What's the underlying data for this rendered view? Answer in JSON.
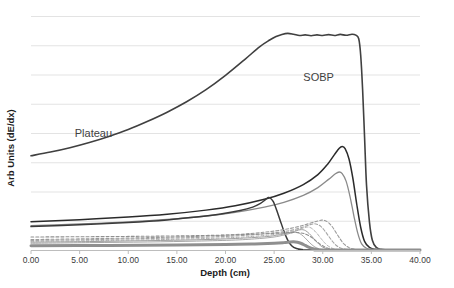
{
  "chart_data": {
    "type": "line",
    "title": "",
    "xlabel": "Depth (cm)",
    "ylabel": "Arb Units (dE/dx)",
    "xlim": [
      0,
      40
    ],
    "ylim": [
      0,
      1.08
    ],
    "xticks": [
      "0.00",
      "5.00",
      "10.00",
      "15.00",
      "20.00",
      "25.00",
      "30.00",
      "35.00",
      "40.00"
    ],
    "xtick_values": [
      0,
      5,
      10,
      15,
      20,
      25,
      30,
      35,
      40
    ],
    "yticks": [],
    "grid": "horizontal",
    "legend": "none",
    "annotations": [
      {
        "text": "SOBP",
        "x": 28.0,
        "y": 0.78,
        "name": "sobp-annotation"
      },
      {
        "text": "Plateau",
        "x": 4.5,
        "y": 0.52,
        "name": "plateau-annotation"
      }
    ],
    "series": [
      {
        "name": "SOBP composite",
        "style": "solid",
        "color": "#404040",
        "width": 1.6,
        "points": [
          [
            0.0,
            0.435
          ],
          [
            2.0,
            0.452
          ],
          [
            4.0,
            0.472
          ],
          [
            6.0,
            0.496
          ],
          [
            8.0,
            0.524
          ],
          [
            10.0,
            0.556
          ],
          [
            12.0,
            0.594
          ],
          [
            14.0,
            0.636
          ],
          [
            16.0,
            0.684
          ],
          [
            18.0,
            0.74
          ],
          [
            20.0,
            0.806
          ],
          [
            22.0,
            0.88
          ],
          [
            23.5,
            0.938
          ],
          [
            24.5,
            0.968
          ],
          [
            25.2,
            0.985
          ],
          [
            25.8,
            0.995
          ],
          [
            26.4,
            1.0
          ],
          [
            27.0,
            0.996
          ],
          [
            27.6,
            0.99
          ],
          [
            28.2,
            0.993
          ],
          [
            28.8,
            0.989
          ],
          [
            29.4,
            0.993
          ],
          [
            30.0,
            0.99
          ],
          [
            30.6,
            0.994
          ],
          [
            31.2,
            0.99
          ],
          [
            31.8,
            0.995
          ],
          [
            32.4,
            0.991
          ],
          [
            33.0,
            0.996
          ],
          [
            33.4,
            0.992
          ],
          [
            33.7,
            0.975
          ],
          [
            33.9,
            0.9
          ],
          [
            34.1,
            0.74
          ],
          [
            34.3,
            0.52
          ],
          [
            34.5,
            0.3
          ],
          [
            34.8,
            0.13
          ],
          [
            35.1,
            0.045
          ],
          [
            35.5,
            0.012
          ],
          [
            36.0,
            0.003
          ],
          [
            37.0,
            0.0
          ],
          [
            40.0,
            0.0
          ]
        ]
      },
      {
        "name": "Bragg peak 1 (highest weight, deepest)",
        "style": "solid",
        "color": "#2b2b2b",
        "width": 1.5,
        "points": [
          [
            0.0,
            0.13
          ],
          [
            5.0,
            0.14
          ],
          [
            10.0,
            0.152
          ],
          [
            14.0,
            0.165
          ],
          [
            18.0,
            0.184
          ],
          [
            21.0,
            0.204
          ],
          [
            24.0,
            0.234
          ],
          [
            26.0,
            0.262
          ],
          [
            28.0,
            0.302
          ],
          [
            29.5,
            0.348
          ],
          [
            30.5,
            0.396
          ],
          [
            31.2,
            0.44
          ],
          [
            31.7,
            0.47
          ],
          [
            32.0,
            0.478
          ],
          [
            32.3,
            0.468
          ],
          [
            32.7,
            0.42
          ],
          [
            33.1,
            0.33
          ],
          [
            33.5,
            0.21
          ],
          [
            33.9,
            0.105
          ],
          [
            34.3,
            0.04
          ],
          [
            34.8,
            0.012
          ],
          [
            35.4,
            0.003
          ],
          [
            36.0,
            0.0
          ],
          [
            40.0,
            0.0
          ]
        ]
      },
      {
        "name": "Bragg peak 2",
        "style": "solid",
        "color": "#8a8a8a",
        "width": 1.3,
        "points": [
          [
            0.0,
            0.112
          ],
          [
            5.0,
            0.12
          ],
          [
            10.0,
            0.13
          ],
          [
            14.0,
            0.141
          ],
          [
            18.0,
            0.157
          ],
          [
            21.0,
            0.174
          ],
          [
            24.0,
            0.198
          ],
          [
            26.0,
            0.22
          ],
          [
            28.0,
            0.252
          ],
          [
            29.5,
            0.288
          ],
          [
            30.6,
            0.326
          ],
          [
            31.3,
            0.352
          ],
          [
            31.7,
            0.36
          ],
          [
            32.0,
            0.352
          ],
          [
            32.4,
            0.318
          ],
          [
            32.8,
            0.248
          ],
          [
            33.2,
            0.158
          ],
          [
            33.6,
            0.078
          ],
          [
            34.0,
            0.028
          ],
          [
            34.5,
            0.008
          ],
          [
            35.0,
            0.002
          ],
          [
            36.0,
            0.0
          ],
          [
            40.0,
            0.0
          ]
        ]
      },
      {
        "name": "Bragg peak 3 (shallow, sharp)",
        "style": "solid",
        "color": "#3a3a3a",
        "width": 1.5,
        "points": [
          [
            0.0,
            0.108
          ],
          [
            5.0,
            0.116
          ],
          [
            10.0,
            0.127
          ],
          [
            14.0,
            0.139
          ],
          [
            17.0,
            0.152
          ],
          [
            19.5,
            0.166
          ],
          [
            21.5,
            0.182
          ],
          [
            22.8,
            0.198
          ],
          [
            23.6,
            0.215
          ],
          [
            24.1,
            0.232
          ],
          [
            24.4,
            0.242
          ],
          [
            24.6,
            0.24
          ],
          [
            24.9,
            0.224
          ],
          [
            25.2,
            0.192
          ],
          [
            25.6,
            0.14
          ],
          [
            26.0,
            0.088
          ],
          [
            26.4,
            0.046
          ],
          [
            26.8,
            0.02
          ],
          [
            27.3,
            0.007
          ],
          [
            27.9,
            0.002
          ],
          [
            28.6,
            0.0
          ],
          [
            40.0,
            0.0
          ]
        ]
      },
      {
        "name": "Bragg peak 4 (dashed)",
        "style": "dashed",
        "color": "#9a9a9a",
        "width": 1.1,
        "points": [
          [
            0.0,
            0.048
          ],
          [
            6.0,
            0.052
          ],
          [
            12.0,
            0.057
          ],
          [
            17.0,
            0.063
          ],
          [
            21.0,
            0.071
          ],
          [
            24.0,
            0.082
          ],
          [
            26.0,
            0.094
          ],
          [
            27.5,
            0.108
          ],
          [
            28.6,
            0.122
          ],
          [
            29.4,
            0.133
          ],
          [
            29.9,
            0.138
          ],
          [
            30.2,
            0.136
          ],
          [
            30.6,
            0.126
          ],
          [
            31.0,
            0.106
          ],
          [
            31.4,
            0.078
          ],
          [
            31.8,
            0.05
          ],
          [
            32.2,
            0.027
          ],
          [
            32.7,
            0.011
          ],
          [
            33.2,
            0.004
          ],
          [
            33.8,
            0.001
          ],
          [
            34.5,
            0.0
          ],
          [
            40.0,
            0.0
          ]
        ]
      },
      {
        "name": "Bragg peak 5 (dashed)",
        "style": "dashed",
        "color": "#a5a5a5",
        "width": 1.1,
        "points": [
          [
            0.0,
            0.044
          ],
          [
            6.0,
            0.048
          ],
          [
            12.0,
            0.053
          ],
          [
            17.0,
            0.058
          ],
          [
            21.0,
            0.065
          ],
          [
            24.0,
            0.075
          ],
          [
            26.0,
            0.085
          ],
          [
            27.2,
            0.096
          ],
          [
            28.1,
            0.108
          ],
          [
            28.7,
            0.117
          ],
          [
            29.1,
            0.121
          ],
          [
            29.4,
            0.119
          ],
          [
            29.8,
            0.109
          ],
          [
            30.2,
            0.089
          ],
          [
            30.6,
            0.064
          ],
          [
            31.0,
            0.04
          ],
          [
            31.4,
            0.021
          ],
          [
            31.9,
            0.008
          ],
          [
            32.4,
            0.003
          ],
          [
            33.0,
            0.001
          ],
          [
            33.6,
            0.0
          ],
          [
            40.0,
            0.0
          ]
        ]
      },
      {
        "name": "Bragg peak 6 (dashed)",
        "style": "dashed",
        "color": "#aeaeae",
        "width": 1.0,
        "points": [
          [
            0.0,
            0.04
          ],
          [
            6.0,
            0.043
          ],
          [
            12.0,
            0.047
          ],
          [
            17.0,
            0.052
          ],
          [
            21.0,
            0.058
          ],
          [
            24.0,
            0.067
          ],
          [
            25.8,
            0.077
          ],
          [
            26.9,
            0.087
          ],
          [
            27.6,
            0.096
          ],
          [
            28.1,
            0.103
          ],
          [
            28.4,
            0.106
          ],
          [
            28.7,
            0.104
          ],
          [
            29.0,
            0.095
          ],
          [
            29.4,
            0.077
          ],
          [
            29.8,
            0.054
          ],
          [
            30.2,
            0.033
          ],
          [
            30.6,
            0.017
          ],
          [
            31.1,
            0.006
          ],
          [
            31.6,
            0.002
          ],
          [
            32.2,
            0.0
          ],
          [
            40.0,
            0.0
          ]
        ]
      },
      {
        "name": "Bragg peak 7",
        "style": "solid",
        "color": "#9e9e9e",
        "width": 1.0,
        "points": [
          [
            0.0,
            0.036
          ],
          [
            6.0,
            0.039
          ],
          [
            12.0,
            0.043
          ],
          [
            17.0,
            0.047
          ],
          [
            21.0,
            0.053
          ],
          [
            24.0,
            0.061
          ],
          [
            25.4,
            0.069
          ],
          [
            26.4,
            0.078
          ],
          [
            27.1,
            0.086
          ],
          [
            27.5,
            0.092
          ],
          [
            27.8,
            0.094
          ],
          [
            28.1,
            0.092
          ],
          [
            28.4,
            0.084
          ],
          [
            28.8,
            0.067
          ],
          [
            29.2,
            0.046
          ],
          [
            29.6,
            0.027
          ],
          [
            30.0,
            0.013
          ],
          [
            30.5,
            0.005
          ],
          [
            31.0,
            0.001
          ],
          [
            31.6,
            0.0
          ],
          [
            40.0,
            0.0
          ]
        ]
      },
      {
        "name": "Bragg peak 8",
        "style": "solid",
        "color": "#a8a8a8",
        "width": 1.0,
        "points": [
          [
            0.0,
            0.031
          ],
          [
            6.0,
            0.034
          ],
          [
            12.0,
            0.037
          ],
          [
            17.0,
            0.041
          ],
          [
            21.0,
            0.046
          ],
          [
            23.5,
            0.053
          ],
          [
            25.0,
            0.06
          ],
          [
            25.9,
            0.068
          ],
          [
            26.5,
            0.075
          ],
          [
            26.9,
            0.08
          ],
          [
            27.2,
            0.082
          ],
          [
            27.5,
            0.079
          ],
          [
            27.8,
            0.071
          ],
          [
            28.2,
            0.055
          ],
          [
            28.6,
            0.036
          ],
          [
            29.0,
            0.02
          ],
          [
            29.4,
            0.009
          ],
          [
            29.9,
            0.003
          ],
          [
            30.5,
            0.001
          ],
          [
            31.0,
            0.0
          ],
          [
            40.0,
            0.0
          ]
        ]
      },
      {
        "name": "Bragg peak 9 (low weight band)",
        "style": "solid",
        "color": "#8f8f8f",
        "width": 3.0,
        "points": [
          [
            0.0,
            0.02
          ],
          [
            8.0,
            0.021
          ],
          [
            15.0,
            0.023
          ],
          [
            20.0,
            0.025
          ],
          [
            23.0,
            0.028
          ],
          [
            25.0,
            0.031
          ],
          [
            26.0,
            0.034
          ],
          [
            26.6,
            0.037
          ],
          [
            27.0,
            0.038
          ],
          [
            27.4,
            0.036
          ],
          [
            27.8,
            0.03
          ],
          [
            28.2,
            0.021
          ],
          [
            28.6,
            0.012
          ],
          [
            29.0,
            0.006
          ],
          [
            29.5,
            0.002
          ],
          [
            30.0,
            0.0
          ],
          [
            40.0,
            0.0
          ]
        ]
      },
      {
        "name": "Bragg peak 10 (dashed low)",
        "style": "dashed",
        "color": "#909090",
        "width": 1.1,
        "points": [
          [
            0.0,
            0.06
          ],
          [
            8.0,
            0.062
          ],
          [
            15.0,
            0.065
          ],
          [
            20.0,
            0.069
          ],
          [
            23.0,
            0.073
          ],
          [
            25.0,
            0.077
          ],
          [
            26.5,
            0.08
          ],
          [
            27.5,
            0.08
          ],
          [
            28.2,
            0.074
          ],
          [
            28.8,
            0.06
          ],
          [
            29.3,
            0.042
          ],
          [
            29.8,
            0.025
          ],
          [
            30.3,
            0.012
          ],
          [
            30.8,
            0.005
          ],
          [
            31.4,
            0.001
          ],
          [
            32.0,
            0.0
          ],
          [
            40.0,
            0.0
          ]
        ]
      }
    ]
  },
  "axis": {
    "x_title": "Depth (cm)",
    "y_title": "Arb Units (dE/dx)"
  }
}
